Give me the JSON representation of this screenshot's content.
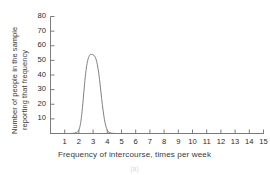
{
  "chart_data": {
    "type": "line",
    "title": "",
    "xlabel": "Frequency of intercourse, times per week",
    "ylabel": "Number of people in the sample reporting that frequency",
    "ylabel_lines": [
      "Number of people in the sample",
      "reporting that frequency"
    ],
    "xlim": [
      0,
      15
    ],
    "ylim": [
      0,
      80
    ],
    "xticks": [
      1,
      2,
      3,
      4,
      5,
      6,
      7,
      8,
      9,
      10,
      11,
      12,
      13,
      14,
      15
    ],
    "yticks": [
      10,
      20,
      30,
      40,
      50,
      60,
      70,
      80
    ],
    "xtick_labels": [
      "1",
      "2",
      "3",
      "4",
      "5",
      "6",
      "7",
      "8",
      "9",
      "10",
      "11",
      "12",
      "13",
      "14",
      "15"
    ],
    "ytick_labels": [
      "10",
      "20",
      "30",
      "40",
      "50",
      "60",
      "70",
      "80"
    ],
    "grid": false,
    "legend": null,
    "line_color": "#7a7a7a",
    "axis_color": "#6e6e6e",
    "peak_x": 3.0,
    "peak_y": 54,
    "series": [
      {
        "name": "distribution",
        "x": [
          0.0,
          0.5,
          1.0,
          1.4,
          1.7,
          1.9,
          2.0,
          2.1,
          2.2,
          2.3,
          2.4,
          2.5,
          2.6,
          2.7,
          2.8,
          2.9,
          3.0,
          3.1,
          3.2,
          3.3,
          3.4,
          3.5,
          3.6,
          3.7,
          3.8,
          3.9,
          4.0,
          4.1,
          4.3,
          4.6,
          5.0,
          6.0,
          7.0,
          8.0,
          9.0,
          10.0,
          11.0,
          12.0,
          13.0,
          14.0,
          15.0
        ],
        "y": [
          0,
          0,
          0,
          0,
          0.3,
          1.2,
          2.5,
          6,
          13,
          23,
          34,
          43,
          49,
          52.5,
          54,
          54,
          53.8,
          53,
          51,
          47,
          41,
          33,
          24,
          16,
          9.5,
          5,
          2.2,
          0.9,
          0.2,
          0,
          0,
          0,
          0,
          0,
          0,
          0,
          0,
          0,
          0,
          0,
          0
        ]
      }
    ]
  },
  "figure": {
    "caption": "(a)"
  }
}
